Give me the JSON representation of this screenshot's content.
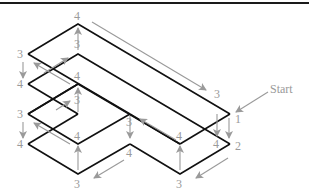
{
  "figure": {
    "start_label": "Start",
    "colors": {
      "edges": "#111111",
      "arrows": "#9a9a9a",
      "labels": "#9a9a9a",
      "rule": "#1a1a1a"
    },
    "labels": [
      {
        "id": "top-apex-outer",
        "text": "4",
        "x": 74,
        "y": 20
      },
      {
        "id": "top-apex-inner",
        "text": "3",
        "x": 74,
        "y": 48
      },
      {
        "id": "left-1",
        "text": "3",
        "x": 18,
        "y": 58
      },
      {
        "id": "left-2",
        "text": "4",
        "x": 18,
        "y": 88
      },
      {
        "id": "left-3",
        "text": "3",
        "x": 18,
        "y": 118
      },
      {
        "id": "left-4",
        "text": "4",
        "x": 18,
        "y": 148
      },
      {
        "id": "mid-upper-4",
        "text": "4",
        "x": 74,
        "y": 80
      },
      {
        "id": "mid-upper-3",
        "text": "3",
        "x": 74,
        "y": 104
      },
      {
        "id": "mid-lower-4",
        "text": "4",
        "x": 74,
        "y": 140
      },
      {
        "id": "bottom-left-3",
        "text": "3",
        "x": 74,
        "y": 188
      },
      {
        "id": "center-3",
        "text": "3",
        "x": 126,
        "y": 126
      },
      {
        "id": "center-4",
        "text": "4",
        "x": 126,
        "y": 157
      },
      {
        "id": "right-top-3",
        "text": "3",
        "x": 214,
        "y": 98
      },
      {
        "id": "right-1",
        "text": "1",
        "x": 235,
        "y": 123
      },
      {
        "id": "right-4",
        "text": "4",
        "x": 215,
        "y": 148
      },
      {
        "id": "right-2",
        "text": "2",
        "x": 235,
        "y": 150
      },
      {
        "id": "inner-right-4",
        "text": "4",
        "x": 176,
        "y": 140
      },
      {
        "id": "bottom-right-3",
        "text": "3",
        "x": 176,
        "y": 188
      }
    ]
  }
}
